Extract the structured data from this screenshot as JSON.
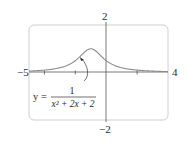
{
  "chart_data": {
    "type": "line",
    "title": "",
    "xlabel": "",
    "ylabel": "",
    "xlim": [
      -5,
      4
    ],
    "ylim": [
      -2,
      2
    ],
    "grid": false,
    "x_tick_marks": [
      -4,
      -2,
      2
    ],
    "tick_labels": {
      "x_min": "−5",
      "x_max": "4",
      "y_max": "2",
      "y_min": "−2"
    },
    "annotation": {
      "lhs": "y =",
      "numerator": "1",
      "denominator": "x² + 2x + 2",
      "arrow_target": [
        -1.3,
        0.6
      ]
    },
    "series": [
      {
        "name": "y = 1/(x^2 + 2x + 2)",
        "x": [
          -5,
          -4.5,
          -4,
          -3.5,
          -3,
          -2.5,
          -2,
          -1.75,
          -1.5,
          -1.25,
          -1,
          -0.75,
          -0.5,
          -0.25,
          0,
          0.5,
          1,
          1.5,
          2,
          2.5,
          3,
          3.5,
          4
        ],
        "values": [
          0.059,
          0.075,
          0.1,
          0.138,
          0.2,
          0.308,
          0.5,
          0.64,
          0.8,
          0.941,
          1.0,
          0.941,
          0.8,
          0.64,
          0.5,
          0.308,
          0.2,
          0.138,
          0.1,
          0.075,
          0.059,
          0.047,
          0.038
        ]
      }
    ],
    "colors": {
      "curve": "#8a8a8a",
      "axes": "#555555",
      "frame": "#d0d0d0"
    }
  }
}
